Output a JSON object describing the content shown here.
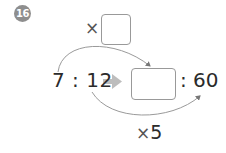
{
  "problem": {
    "number": "16",
    "top_operator": "×",
    "top_blank": "",
    "left_ratio": "7 : 12",
    "answer_blank": "",
    "right_ratio": ": 60",
    "bottom_operator": "×",
    "bottom_multiplier": "5"
  },
  "colors": {
    "badge": "#8e8e8e",
    "arrow": "#bdbdbd",
    "curve": "#9a9a9a",
    "text": "#2b2b2b"
  }
}
